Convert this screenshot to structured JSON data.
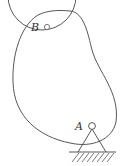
{
  "diagram": {
    "type": "cam-mechanism",
    "labels": {
      "point_a": "A",
      "point_b": "B"
    },
    "colors": {
      "stroke": "#444444",
      "background": "#ffffff"
    }
  }
}
